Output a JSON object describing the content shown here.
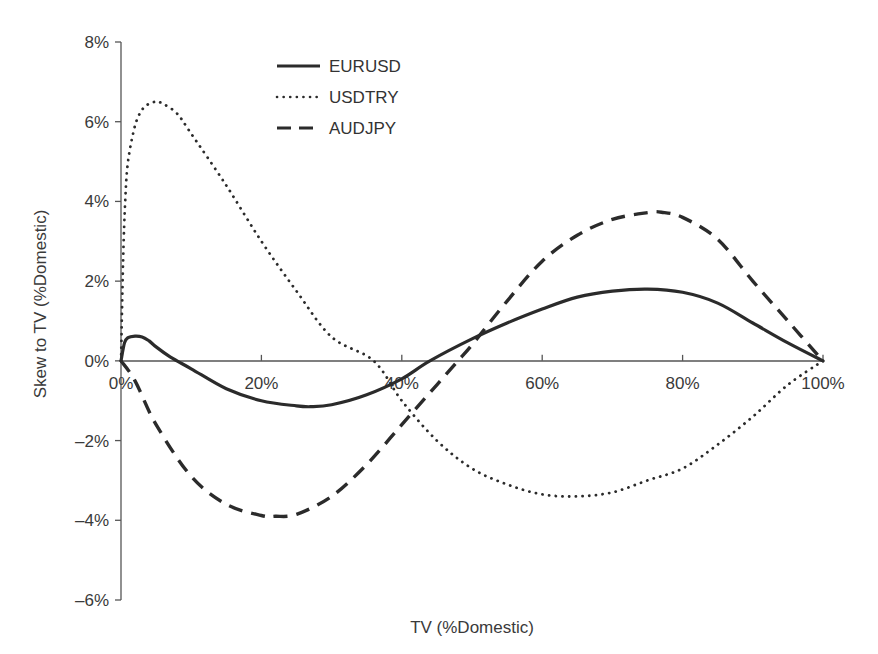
{
  "chart_data": {
    "type": "line",
    "title": "",
    "xlabel": "TV (%Domestic)",
    "ylabel": "Skew to TV (%Domestic)",
    "xlim": [
      0,
      100
    ],
    "ylim": [
      -6,
      8
    ],
    "x_ticks": [
      "0%",
      "20%",
      "40%",
      "60%",
      "80%",
      "100%"
    ],
    "y_ticks": [
      "8%",
      "6%",
      "4%",
      "2%",
      "0%",
      "-2%",
      "-4%",
      "-6%"
    ],
    "grid": false,
    "legend_position": "upper-center-left",
    "series": [
      {
        "name": "EURUSD",
        "style": "solid",
        "x": [
          0,
          0.5,
          1,
          2,
          3,
          4,
          5,
          7,
          10,
          15,
          20,
          25,
          27,
          30,
          35,
          40,
          44,
          50,
          55,
          60,
          65,
          70,
          75,
          80,
          85,
          90,
          95,
          100
        ],
        "y": [
          0,
          0.45,
          0.58,
          0.62,
          0.6,
          0.5,
          0.35,
          0.1,
          -0.2,
          -0.7,
          -1.0,
          -1.13,
          -1.15,
          -1.1,
          -0.85,
          -0.45,
          0.0,
          0.55,
          0.95,
          1.3,
          1.6,
          1.75,
          1.8,
          1.72,
          1.45,
          0.95,
          0.45,
          0
        ]
      },
      {
        "name": "USDTRY",
        "style": "dotted",
        "x": [
          0,
          0.3,
          0.6,
          1,
          2,
          3,
          4,
          5,
          6,
          8,
          10,
          15,
          20,
          25,
          30,
          36,
          40,
          45,
          50,
          55,
          60,
          65,
          70,
          75,
          80,
          85,
          90,
          95,
          100
        ],
        "y": [
          0,
          2.5,
          4.0,
          5.0,
          5.9,
          6.3,
          6.45,
          6.5,
          6.45,
          6.2,
          5.7,
          4.4,
          3.0,
          1.75,
          0.6,
          0.0,
          -1.0,
          -2.0,
          -2.7,
          -3.1,
          -3.35,
          -3.4,
          -3.3,
          -3.0,
          -2.7,
          -2.1,
          -1.4,
          -0.6,
          0
        ]
      },
      {
        "name": "AUDJPY",
        "style": "dashed",
        "x": [
          0,
          2,
          5,
          10,
          15,
          20,
          22,
          25,
          30,
          35,
          40,
          45,
          48,
          50,
          55,
          60,
          65,
          70,
          75,
          77,
          80,
          85,
          90,
          95,
          100
        ],
        "y": [
          0,
          -0.5,
          -1.6,
          -2.9,
          -3.6,
          -3.88,
          -3.9,
          -3.85,
          -3.4,
          -2.6,
          -1.6,
          -0.6,
          0.0,
          0.4,
          1.5,
          2.5,
          3.15,
          3.55,
          3.72,
          3.73,
          3.6,
          3.05,
          2.0,
          1.0,
          0
        ]
      }
    ]
  },
  "axes": {
    "x_title": "TV (%Domestic)",
    "y_title": "Skew to TV (%Domestic)",
    "x_tick_labels": [
      "0%",
      "20%",
      "40%",
      "60%",
      "80%",
      "100%"
    ],
    "y_tick_labels": [
      "8%",
      "6%",
      "4%",
      "2%",
      "0%",
      "–2%",
      "–4%",
      "–6%"
    ]
  },
  "legend": {
    "items": [
      {
        "label": "EURUSD",
        "style": "solid"
      },
      {
        "label": "USDTRY",
        "style": "dotted"
      },
      {
        "label": "AUDJPY",
        "style": "dashed"
      }
    ]
  },
  "colors": {
    "line": "#2b2b2b",
    "axis": "#555555",
    "text": "#3a3a3a",
    "background": "#ffffff"
  }
}
